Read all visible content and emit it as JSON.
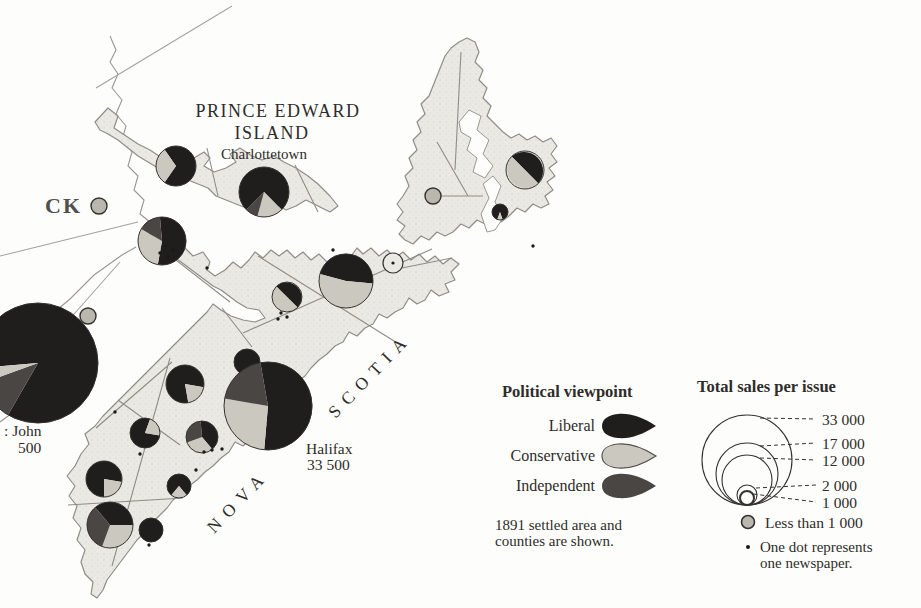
{
  "colors": {
    "liberal": "#201e1d",
    "conservative": "#cbc9bf",
    "independent": "#4a4643",
    "land": "#eae9e3",
    "coast": "#8f8d86",
    "ink": "#2e2c29",
    "dot": "#1b1a18",
    "lt1000_fill": "#b9b7ae",
    "pie_outline": "#34322f"
  },
  "map": {
    "labels": [
      {
        "id": "pei-name-line1",
        "text": "PRINCE EDWARD",
        "x": 278,
        "y": 102,
        "size": 18,
        "ls": 1.5,
        "align": "center"
      },
      {
        "id": "pei-name-line2",
        "text": "ISLAND",
        "x": 272,
        "y": 124,
        "size": 18,
        "ls": 1.5,
        "align": "center"
      },
      {
        "id": "charlottetown-label",
        "text": "Charlottetown",
        "x": 264,
        "y": 147,
        "size": 15,
        "align": "center"
      },
      {
        "id": "new-brunswick-partial",
        "text": "CK",
        "x": 45,
        "y": 194,
        "size": 22,
        "ls": 2,
        "align": "left",
        "color": "#514f4b",
        "weight": "600"
      },
      {
        "id": "saint-john-label",
        "text": ": John",
        "x": 4,
        "y": 423,
        "size": 15.5,
        "align": "left"
      },
      {
        "id": "saint-john-sales",
        "text": "500",
        "x": 18,
        "y": 440,
        "size": 15.5,
        "align": "left"
      },
      {
        "id": "halifax-label",
        "text": "Halifax",
        "x": 306,
        "y": 441,
        "size": 15.5,
        "align": "left"
      },
      {
        "id": "halifax-sales",
        "text": "33 500",
        "x": 307,
        "y": 457,
        "size": 15.5,
        "align": "left"
      },
      {
        "id": "nova-label",
        "text": "NOVA",
        "x": 238,
        "y": 501,
        "size": 17.5,
        "ls": 8,
        "align": "rot"
      },
      {
        "id": "scotia-label",
        "text": "SCOTIA",
        "x": 370,
        "y": 375,
        "size": 17.5,
        "ls": 8,
        "align": "rot"
      }
    ],
    "pies": [
      {
        "name": "saint-john",
        "cx": 38,
        "cy": 363,
        "r": 60,
        "slices": [
          {
            "party": "liberal",
            "start": 265,
            "sweep": 305
          },
          {
            "party": "independent",
            "start": 210,
            "sweep": 40
          },
          {
            "party": "conservative",
            "start": 250,
            "sweep": 15
          }
        ]
      },
      {
        "name": "pei-west",
        "cx": 176,
        "cy": 166,
        "r": 20,
        "slices": [
          {
            "party": "liberal",
            "start": 325,
            "sweep": 250
          },
          {
            "party": "conservative",
            "start": 215,
            "sweep": 110
          }
        ]
      },
      {
        "name": "charlottetown",
        "cx": 264,
        "cy": 192,
        "r": 25,
        "slices": [
          {
            "party": "liberal",
            "start": 225,
            "sweep": 270
          },
          {
            "party": "conservative",
            "start": 135,
            "sweep": 60
          },
          {
            "party": "independent",
            "start": 195,
            "sweep": 30
          }
        ]
      },
      {
        "name": "cumberland",
        "cx": 162,
        "cy": 241,
        "r": 24,
        "slices": [
          {
            "party": "liberal",
            "start": 355,
            "sweep": 195
          },
          {
            "party": "conservative",
            "start": 190,
            "sweep": 110
          },
          {
            "party": "independent",
            "start": 300,
            "sweep": 55
          }
        ]
      },
      {
        "name": "pictou",
        "cx": 346,
        "cy": 281,
        "r": 27,
        "slices": [
          {
            "party": "liberal",
            "start": 285,
            "sweep": 170
          },
          {
            "party": "conservative",
            "start": 95,
            "sweep": 190
          }
        ]
      },
      {
        "name": "tatamagouche",
        "cx": 287,
        "cy": 297,
        "r": 15,
        "slices": [
          {
            "party": "liberal",
            "start": 315,
            "sweep": 180
          },
          {
            "party": "conservative",
            "start": 135,
            "sweep": 180
          }
        ]
      },
      {
        "name": "sydney",
        "cx": 525,
        "cy": 170,
        "r": 19,
        "slices": [
          {
            "party": "liberal",
            "start": 315,
            "sweep": 180
          },
          {
            "party": "conservative",
            "start": 135,
            "sweep": 180
          }
        ]
      },
      {
        "name": "sydney-south",
        "cx": 500,
        "cy": 212,
        "r": 8,
        "slices": [
          {
            "party": "liberal",
            "start": 200,
            "sweep": 320
          },
          {
            "party": "conservative",
            "start": 160,
            "sweep": 40
          }
        ]
      },
      {
        "name": "windsor",
        "cx": 185,
        "cy": 384,
        "r": 19,
        "slices": [
          {
            "party": "liberal",
            "start": 170,
            "sweep": 290
          },
          {
            "party": "conservative",
            "start": 100,
            "sweep": 70
          }
        ]
      },
      {
        "name": "dartmouth",
        "cx": 247,
        "cy": 362,
        "r": 13,
        "slices": [
          {
            "party": "liberal",
            "start": 0,
            "sweep": 360
          }
        ]
      },
      {
        "name": "halifax",
        "cx": 268,
        "cy": 406,
        "r": 44,
        "slices": [
          {
            "party": "liberal",
            "start": 350,
            "sweep": 195
          },
          {
            "party": "conservative",
            "start": 185,
            "sweep": 95
          },
          {
            "party": "independent",
            "start": 280,
            "sweep": 70
          }
        ]
      },
      {
        "name": "lunenburg",
        "cx": 179,
        "cy": 486,
        "r": 12,
        "slices": [
          {
            "party": "liberal",
            "start": 220,
            "sweep": 280
          },
          {
            "party": "conservative",
            "start": 140,
            "sweep": 80
          }
        ]
      },
      {
        "name": "bridgewater",
        "cx": 145,
        "cy": 433,
        "r": 15,
        "slices": [
          {
            "party": "liberal",
            "start": 100,
            "sweep": 280
          },
          {
            "party": "conservative",
            "start": 20,
            "sweep": 80
          }
        ]
      },
      {
        "name": "liverpool",
        "cx": 202,
        "cy": 437,
        "r": 16,
        "slices": [
          {
            "party": "liberal",
            "start": 355,
            "sweep": 145
          },
          {
            "party": "conservative",
            "start": 140,
            "sweep": 110
          },
          {
            "party": "independent",
            "start": 250,
            "sweep": 105
          }
        ]
      },
      {
        "name": "shelburne",
        "cx": 104,
        "cy": 479,
        "r": 18,
        "slices": [
          {
            "party": "liberal",
            "start": 180,
            "sweep": 280
          },
          {
            "party": "conservative",
            "start": 100,
            "sweep": 80
          }
        ]
      },
      {
        "name": "yarmouth",
        "cx": 110,
        "cy": 525,
        "r": 23,
        "slices": [
          {
            "party": "liberal",
            "start": 320,
            "sweep": 130
          },
          {
            "party": "conservative",
            "start": 90,
            "sweep": 110
          },
          {
            "party": "independent",
            "start": 200,
            "sweep": 120
          }
        ]
      },
      {
        "name": "barrington",
        "cx": 151,
        "cy": 530,
        "r": 12,
        "slices": [
          {
            "party": "liberal",
            "start": 0,
            "sweep": 360
          }
        ]
      }
    ],
    "small_circles": [
      {
        "cx": 99,
        "cy": 206,
        "r": 8
      },
      {
        "cx": 88,
        "cy": 316,
        "r": 8
      },
      {
        "cx": 433,
        "cy": 196,
        "r": 8
      }
    ],
    "outline_circles": [
      {
        "cx": 393,
        "cy": 263,
        "r": 10,
        "dot": true
      }
    ],
    "dots": [
      [
        166,
        246
      ],
      [
        173,
        250
      ],
      [
        160,
        253
      ],
      [
        168,
        257
      ],
      [
        207,
        268
      ],
      [
        281,
        313
      ],
      [
        287,
        317
      ],
      [
        278,
        319
      ],
      [
        333,
        250
      ],
      [
        533,
        246
      ],
      [
        115,
        412
      ],
      [
        140,
        454
      ],
      [
        204,
        452
      ],
      [
        212,
        450
      ],
      [
        222,
        449
      ],
      [
        196,
        470
      ],
      [
        149,
        545
      ]
    ]
  },
  "legend_viewpoint": {
    "title": "Political viewpoint",
    "items": [
      {
        "label": "Liberal",
        "party": "liberal"
      },
      {
        "label": "Conservative",
        "party": "conservative"
      },
      {
        "label": "Independent",
        "party": "independent"
      }
    ],
    "note_line1": "1891 settled area and",
    "note_line2": "counties are shown."
  },
  "legend_sales": {
    "title": "Total sales per issue",
    "center_x": 747,
    "baseline_y": 505,
    "label_x": 822,
    "rings": [
      {
        "label": "33 000",
        "r": 45,
        "label_y": 414
      },
      {
        "label": "17 000",
        "r": 31,
        "label_y": 438
      },
      {
        "label": "12 000",
        "r": 25,
        "label_y": 455
      },
      {
        "label": "2 000",
        "r": 10,
        "label_y": 480
      },
      {
        "label": "1 000",
        "r": 7,
        "label_y": 497
      }
    ],
    "less_than_label": "Less than 1 000",
    "dot_note_line1": "One dot represents",
    "dot_note_line2": "one newspaper."
  }
}
